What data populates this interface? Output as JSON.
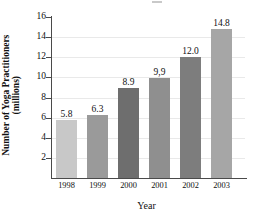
{
  "chart_data": {
    "type": "bar",
    "title": "",
    "xlabel": "Year",
    "ylabel": "Number of Yoga Practitioners (millions)",
    "ylabel_line1": "Number of Yoga Practitioners",
    "ylabel_line2": "(millions)",
    "categories": [
      "1998",
      "1999",
      "2000",
      "2001",
      "2002",
      "2003"
    ],
    "values": [
      5.8,
      6.3,
      8.9,
      9.9,
      12.0,
      14.8
    ],
    "value_labels": [
      "5.8",
      "6.3",
      "8.9",
      "9,9",
      "12.0",
      "14.8"
    ],
    "bar_colors": [
      "#c8c8c8",
      "#9a9a9a",
      "#6e6e6e",
      "#8f8f8f",
      "#7d7d7d",
      "#a6a6a6"
    ],
    "ylim": [
      0,
      16
    ],
    "ytick_labels": [
      "2",
      "4",
      "6",
      "8",
      "10",
      "12",
      "14",
      "16"
    ],
    "ytick_values": [
      2,
      4,
      6,
      8,
      10,
      12,
      14,
      16
    ],
    "grid": true,
    "grid_color": "#e9e9e9",
    "axis_color": "#4a4a4a",
    "legend": "none"
  }
}
